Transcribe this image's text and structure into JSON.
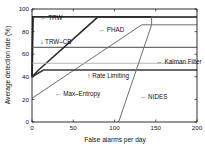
{
  "chart_data": {
    "type": "line",
    "title": "",
    "xlabel": "False alarms per day",
    "ylabel": "Average detection rate (%)",
    "xlim": [
      0,
      200
    ],
    "ylim": [
      0,
      100
    ],
    "xticks": [
      0,
      50,
      100,
      150,
      200
    ],
    "yticks": [
      0,
      20,
      40,
      60,
      80,
      100
    ],
    "xtick_labels": [
      "0",
      "50",
      "100",
      "150",
      "200"
    ],
    "ytick_labels": [
      "0",
      "20",
      "40",
      "60",
      "80",
      "100"
    ],
    "grid": false,
    "legend_position": "inline-annotations",
    "series": [
      {
        "name": "TRW",
        "color": "#2b2b2b",
        "width": 1.9,
        "x": [
          0,
          0.6,
          1.2,
          200
        ],
        "values": [
          40,
          70,
          93,
          93
        ]
      },
      {
        "name": "TRW-CB",
        "color": "#6e6e6e",
        "width": 1.1,
        "x": [
          0,
          200
        ],
        "values": [
          66,
          66
        ]
      },
      {
        "name": "PHAD",
        "color": "#2b2b2b",
        "width": 1.6,
        "x": [
          0,
          8,
          80,
          200
        ],
        "values": [
          40,
          46,
          93,
          93
        ]
      },
      {
        "name": "Max-Entropy",
        "color": "#6e6e6e",
        "width": 1.0,
        "x": [
          0,
          133,
          200
        ],
        "values": [
          21,
          86,
          86
        ]
      },
      {
        "name": "Rate Limiting",
        "color": "#3a3a3a",
        "width": 1.6,
        "x": [
          0,
          14,
          200
        ],
        "values": [
          40,
          46,
          46
        ]
      },
      {
        "name": "Kalman Filter",
        "color": "#b4b4b4",
        "width": 1.2,
        "x": [
          0,
          200
        ],
        "values": [
          52,
          52
        ]
      },
      {
        "name": "NIDES",
        "color": "#6e6e6e",
        "width": 1.0,
        "x": [
          105,
          145,
          145,
          200
        ],
        "values": [
          0,
          86,
          93,
          93
        ]
      }
    ],
    "annotations": [
      {
        "name": "TRW",
        "text": "← TRW",
        "x": 10,
        "y": 92
      },
      {
        "name": "TRW-CB",
        "text": "↓ TRW–CB",
        "x": 10,
        "y": 71
      },
      {
        "name": "PHAD",
        "text": "← PHAD",
        "x": 81,
        "y": 82
      },
      {
        "name": "Kalman Filter",
        "text": "← Kalman Filter",
        "x": 151,
        "y": 53
      },
      {
        "name": "Rate Limiting",
        "text": "↑ Rate Limiting",
        "x": 67,
        "y": 41
      },
      {
        "name": "Max-Entropy",
        "text": "← Max–Entropy",
        "x": 28,
        "y": 25
      },
      {
        "name": "NIDES",
        "text": "← NIDES",
        "x": 131,
        "y": 22
      }
    ]
  }
}
